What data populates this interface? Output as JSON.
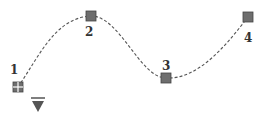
{
  "diagram": {
    "type": "spline-path",
    "colors": {
      "background": "#ffffff",
      "curve": "#555555",
      "point_fill": "#6e6e6e",
      "point_stroke": "#444444",
      "label": "#333333",
      "pointer": "#555555"
    },
    "points": [
      {
        "id": "1",
        "label": "1",
        "x": 18,
        "y": 87,
        "style": "start-grid"
      },
      {
        "id": "2",
        "label": "2",
        "x": 91,
        "y": 16,
        "style": "square"
      },
      {
        "id": "3",
        "label": "3",
        "x": 166,
        "y": 78,
        "style": "square"
      },
      {
        "id": "4",
        "label": "4",
        "x": 248,
        "y": 17,
        "style": "square"
      }
    ],
    "pointer": {
      "icon": "triangle-down-icon",
      "x": 38,
      "y": 104
    }
  }
}
